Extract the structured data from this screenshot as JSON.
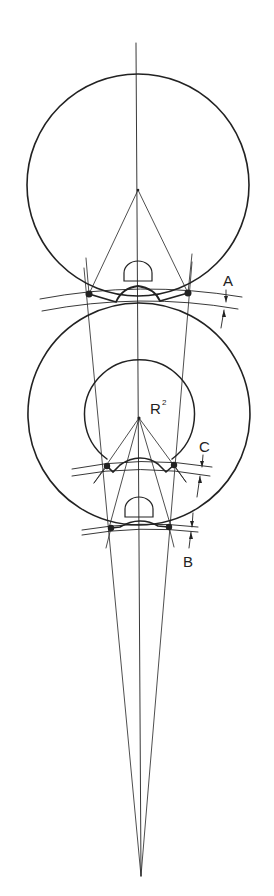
{
  "diagram": {
    "type": "technical-geometry",
    "colors": {
      "line": "#222222",
      "background": "#ffffff"
    },
    "labels": {
      "A": "A",
      "B": "B",
      "C": "C",
      "R": "R",
      "R_sup": "2"
    },
    "circles": [
      {
        "name": "upper-circle",
        "cx": 138,
        "cy": 185,
        "r": 111
      },
      {
        "name": "lower-outer-circle",
        "cx": 139,
        "cy": 418,
        "r": 111
      },
      {
        "name": "lower-inner-circle",
        "cx": 139,
        "cy": 414,
        "r": 55
      }
    ],
    "contact_points": {
      "A": [
        [
          89,
          294
        ],
        [
          188,
          293
        ]
      ],
      "C": [
        [
          107,
          466
        ],
        [
          174,
          465
        ]
      ],
      "B": [
        [
          111,
          528
        ],
        [
          169,
          527
        ]
      ]
    },
    "apex": [
      141,
      876
    ]
  }
}
